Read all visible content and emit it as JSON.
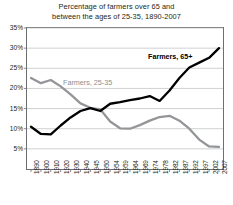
{
  "chart_data": {
    "type": "line",
    "title": "Percentage of farmers over 65 and between the ages of 25-35, 1890-2007",
    "title_line1": "Percentage of farmers over 65 and",
    "title_line2": "between the ages of 25-35, 1890-2007",
    "xlabel": "",
    "ylabel": "",
    "ylim": [
      0,
      35
    ],
    "ytick_labels": [
      "35%",
      "30%",
      "25%",
      "20%",
      "15%",
      "10%",
      "5%"
    ],
    "ytick_values": [
      35,
      30,
      25,
      20,
      15,
      10,
      5
    ],
    "grid": true,
    "legend_position": "inline-annotations",
    "categories": [
      "1890",
      "1900",
      "1910",
      "1920",
      "1930",
      "1940",
      "1945",
      "1950",
      "1954",
      "1959",
      "1964",
      "1969",
      "1974",
      "1978",
      "1982",
      "1987",
      "1992",
      "1997",
      "2002",
      "2007"
    ],
    "series": [
      {
        "name": "Farmers, 65+",
        "color": "#000000",
        "values": [
          10.5,
          8.7,
          8.6,
          10.8,
          12.8,
          14.4,
          15.1,
          14.4,
          16.2,
          16.6,
          17.1,
          17.5,
          18.1,
          16.9,
          19.5,
          22.6,
          25.2,
          26.4,
          27.6,
          30.0
        ]
      },
      {
        "name": "Farmers, 25-35",
        "color": "#939598",
        "values": [
          22.6,
          21.3,
          22.1,
          20.5,
          18.5,
          16.3,
          15.2,
          14.8,
          11.8,
          10.1,
          10.0,
          10.9,
          12.0,
          12.9,
          13.2,
          12.0,
          10.0,
          7.3,
          5.6,
          5.5
        ]
      }
    ],
    "annotations": [
      {
        "name": "black-series-label",
        "text": "Farmers, 65+"
      },
      {
        "name": "gray-series-label",
        "text": "Farmers, 25-35"
      }
    ]
  }
}
